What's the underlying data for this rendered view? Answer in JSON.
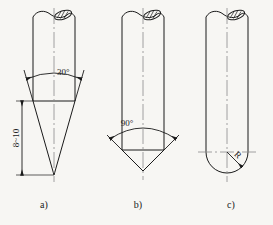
{
  "drawing": {
    "title": "Scriber point shapes",
    "background_color": "#f7f6f3",
    "line_color": "#1a1a1a",
    "centerline_color": "#8a8a8a",
    "figures": [
      {
        "id": "a",
        "caption": "a)",
        "tip_type": "sharp-cone",
        "angle_label": "30°",
        "length_label": "8~10",
        "has_length_dimension": true,
        "has_angle_dimension": true,
        "has_radius_dimension": false,
        "break_symbol": "hatched-ellipse-break"
      },
      {
        "id": "b",
        "caption": "b)",
        "tip_type": "blunt-cone",
        "angle_label": "90°",
        "length_label": "",
        "has_length_dimension": false,
        "has_angle_dimension": true,
        "has_radius_dimension": false,
        "break_symbol": "hatched-ellipse-break"
      },
      {
        "id": "c",
        "caption": "c)",
        "tip_type": "rounded-hemispherical",
        "angle_label": "",
        "length_label": "",
        "radius_label": "R",
        "has_length_dimension": false,
        "has_angle_dimension": false,
        "has_radius_dimension": true,
        "break_symbol": "hatched-ellipse-break"
      }
    ]
  }
}
